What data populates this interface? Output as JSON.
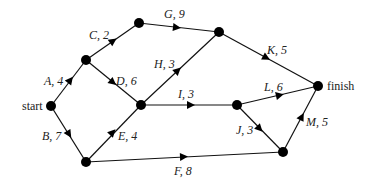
{
  "diagram": {
    "type": "activity-network",
    "nodes": [
      {
        "id": "start",
        "x": 51,
        "y": 106,
        "label": "start"
      },
      {
        "id": "n1",
        "x": 86,
        "y": 60,
        "label": ""
      },
      {
        "id": "n2",
        "x": 139,
        "y": 23,
        "label": ""
      },
      {
        "id": "n3",
        "x": 141,
        "y": 105,
        "label": ""
      },
      {
        "id": "n4",
        "x": 219,
        "y": 32,
        "label": ""
      },
      {
        "id": "n5",
        "x": 237,
        "y": 105,
        "label": ""
      },
      {
        "id": "finish",
        "x": 318,
        "y": 86,
        "label": "finish"
      },
      {
        "id": "n6",
        "x": 86,
        "y": 162,
        "label": ""
      },
      {
        "id": "n7",
        "x": 283,
        "y": 152,
        "label": ""
      }
    ],
    "edges": [
      {
        "activity": "A",
        "duration": 4,
        "label": "A, 4",
        "from": "start",
        "to": "n1"
      },
      {
        "activity": "B",
        "duration": 7,
        "label": "B, 7",
        "from": "start",
        "to": "n6"
      },
      {
        "activity": "C",
        "duration": 2,
        "label": "C, 2",
        "from": "n1",
        "to": "n2"
      },
      {
        "activity": "D",
        "duration": 6,
        "label": "D, 6",
        "from": "n1",
        "to": "n3"
      },
      {
        "activity": "E",
        "duration": 4,
        "label": "E, 4",
        "from": "n6",
        "to": "n3"
      },
      {
        "activity": "F",
        "duration": 8,
        "label": "F, 8",
        "from": "n6",
        "to": "n7"
      },
      {
        "activity": "G",
        "duration": 9,
        "label": "G, 9",
        "from": "n2",
        "to": "n4"
      },
      {
        "activity": "H",
        "duration": 3,
        "label": "H, 3",
        "from": "n3",
        "to": "n4"
      },
      {
        "activity": "I",
        "duration": 3,
        "label": "I, 3",
        "from": "n3",
        "to": "n5"
      },
      {
        "activity": "J",
        "duration": 3,
        "label": "J, 3",
        "from": "n5",
        "to": "n7"
      },
      {
        "activity": "K",
        "duration": 5,
        "label": "K, 5",
        "from": "n4",
        "to": "finish"
      },
      {
        "activity": "L",
        "duration": 6,
        "label": "L, 6",
        "from": "n5",
        "to": "finish"
      },
      {
        "activity": "M",
        "duration": 5,
        "label": "M, 5",
        "from": "n7",
        "to": "finish"
      }
    ],
    "node_labels": {
      "start": "start",
      "finish": "finish"
    },
    "edge_labels": {
      "A": "A, 4",
      "B": "B, 7",
      "C": "C, 2",
      "D": "D, 6",
      "E": "E, 4",
      "F": "F, 8",
      "G": "G, 9",
      "H": "H, 3",
      "I": "I, 3",
      "J": "J, 3",
      "K": "K, 5",
      "L": "L, 6",
      "M": "M, 5"
    }
  }
}
